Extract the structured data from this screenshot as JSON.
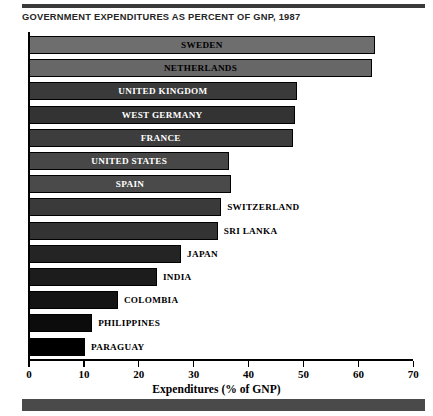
{
  "chart_title": "GOVERNMENT EXPENDITURES AS PERCENT OF GNP, 1987",
  "chart_data": {
    "type": "bar",
    "orientation": "horizontal",
    "title": "GOVERNMENT EXPENDITURES AS PERCENT OF GNP, 1987",
    "subtitle": "",
    "xlabel": "Expenditures (% of GNP)",
    "ylabel": "",
    "xlim": [
      0,
      70
    ],
    "xticks": [
      0,
      10,
      20,
      30,
      40,
      50,
      60,
      70
    ],
    "xtick_labels": [
      "0",
      "10",
      "20",
      "30",
      "40",
      "50",
      "60",
      "70"
    ],
    "grid": false,
    "legend": false,
    "categories": [
      "SWEDEN",
      "NETHERLANDS",
      "UNITED KINGDOM",
      "WEST GERMANY",
      "FRANCE",
      "UNITED STATES",
      "SPAIN",
      "SWITZERLAND",
      "SRI LANKA",
      "JAPAN",
      "INDIA",
      "COLOMBIA",
      "PHILIPPINES",
      "PARAGUAY"
    ],
    "values": [
      63,
      62.5,
      48.8,
      48.5,
      48,
      36.5,
      36.8,
      35,
      34.4,
      27.7,
      23.3,
      16.2,
      11.5,
      10.2
    ],
    "bar_fills": [
      "#6e6e6e",
      "#676767",
      "#3a3a3a",
      "#333333",
      "#3d3d3d",
      "#474747",
      "#4a4a4a",
      "#3a3a3a",
      "#333333",
      "#242424",
      "#1c1c1c",
      "#141414",
      "#0c0c0c",
      "#000000"
    ],
    "label_inside": [
      true,
      true,
      true,
      true,
      true,
      true,
      true,
      false,
      false,
      false,
      false,
      false,
      false,
      false
    ]
  },
  "decor": {
    "rule_color": "#3a3a3a",
    "band_color": "#4a4a4a"
  }
}
